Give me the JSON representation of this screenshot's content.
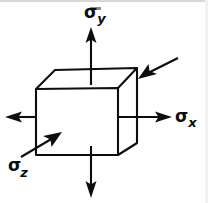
{
  "figure": {
    "name": "triaxial-stress-cube-diagram",
    "background_color": "#ffffff",
    "ink_color": "#0d0d0d",
    "labels": {
      "sigma_y": {
        "symbol": "σ",
        "subscript": "y",
        "axis": "y",
        "position": "top"
      },
      "sigma_x": {
        "symbol": "σ",
        "subscript": "x",
        "axis": "x",
        "position": "right"
      },
      "sigma_z": {
        "symbol": "σ",
        "subscript": "z",
        "axis": "z",
        "position": "bottom-left"
      }
    },
    "arrows": [
      {
        "name": "sigma-y-up-arrow",
        "direction": "up",
        "sense": "tension"
      },
      {
        "name": "sigma-y-down-arrow",
        "direction": "down",
        "sense": "tension"
      },
      {
        "name": "sigma-x-right-arrow",
        "direction": "right",
        "sense": "tension"
      },
      {
        "name": "sigma-x-left-arrow",
        "direction": "left",
        "sense": "tension"
      },
      {
        "name": "sigma-z-out-arrow",
        "direction": "up-right",
        "sense": "tension"
      },
      {
        "name": "sigma-z-in-arrow",
        "direction": "down-left",
        "sense": "compression"
      }
    ],
    "cube": {
      "name": "stress-element-cube",
      "front_face": "36,89 118,88 118,155 36,155",
      "top_face": "36,89 55,70 137,68 118,88",
      "right_face": "118,88 137,68 137,143 118,155"
    }
  }
}
